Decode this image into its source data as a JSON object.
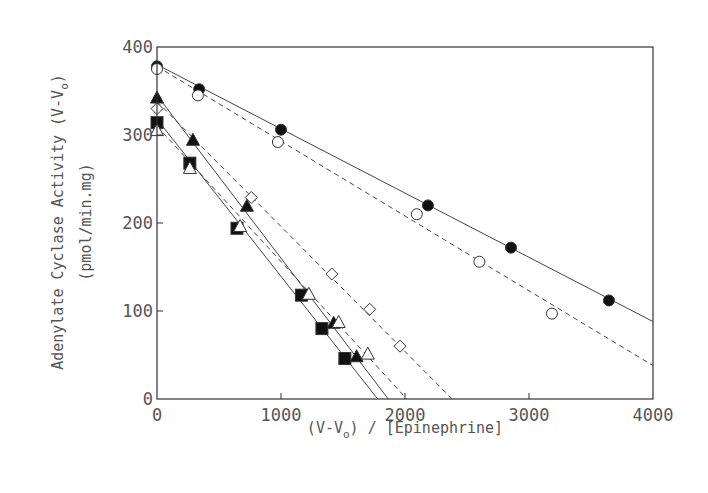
{
  "chart_data": {
    "type": "scatter",
    "title": "",
    "xlabel": "(V-Vo) / [Epinephrine]",
    "xlabel_parts": {
      "pre": "(V-V",
      "sub": "o",
      "post": ") / [Epinephrine]"
    },
    "ylabel": "Adenylate Cyclase Activity (V-Vo) (pmol/min.mg)",
    "ylabel_line1_parts": {
      "pre": "Adenylate Cyclase Activity (V-V",
      "sub": "o",
      "post": ")"
    },
    "ylabel_line2": "(pmol/min.mg)",
    "xlim": [
      0,
      4000
    ],
    "ylim": [
      0,
      400
    ],
    "xticks": [
      0,
      1000,
      2000,
      3000,
      4000
    ],
    "yticks": [
      0,
      100,
      200,
      300,
      400
    ],
    "grid": false,
    "legend": null,
    "series": [
      {
        "name": "filled circles",
        "marker": "circle-filled",
        "line": "solid",
        "points": [
          [
            0,
            378
          ],
          [
            340,
            352
          ],
          [
            1000,
            306
          ],
          [
            2185,
            220
          ],
          [
            2855,
            172
          ],
          [
            3645,
            112
          ]
        ],
        "fit_line": [
          [
            0,
            380
          ],
          [
            4000,
            88
          ]
        ]
      },
      {
        "name": "open circles",
        "marker": "circle-open",
        "line": "dashed",
        "points": [
          [
            0,
            375
          ],
          [
            330,
            345
          ],
          [
            975,
            292
          ],
          [
            2095,
            210
          ],
          [
            2600,
            156
          ],
          [
            3185,
            97
          ]
        ],
        "fit_line": [
          [
            0,
            378
          ],
          [
            4000,
            38
          ]
        ]
      },
      {
        "name": "open diamonds",
        "marker": "diamond-open",
        "line": "dashed",
        "points": [
          [
            0,
            330
          ],
          [
            760,
            229
          ],
          [
            1410,
            142
          ],
          [
            1715,
            102
          ],
          [
            1960,
            60
          ]
        ],
        "fit_line": [
          [
            0,
            338
          ],
          [
            2380,
            0
          ]
        ]
      },
      {
        "name": "filled triangles",
        "marker": "triangle-filled",
        "line": "solid",
        "points": [
          [
            0,
            342
          ],
          [
            290,
            294
          ],
          [
            725,
            219
          ],
          [
            1425,
            86
          ],
          [
            1610,
            48
          ]
        ],
        "fit_line": [
          [
            0,
            345
          ],
          [
            1865,
            0
          ]
        ]
      },
      {
        "name": "filled squares",
        "marker": "square-filled",
        "line": "solid",
        "points": [
          [
            0,
            314
          ],
          [
            265,
            268
          ],
          [
            645,
            194
          ],
          [
            1165,
            118
          ],
          [
            1330,
            80
          ],
          [
            1515,
            46
          ]
        ],
        "fit_line": [
          [
            0,
            318
          ],
          [
            1780,
            0
          ]
        ]
      },
      {
        "name": "open triangles",
        "marker": "triangle-open",
        "line": "dashed",
        "points": [
          [
            0,
            305
          ],
          [
            265,
            262
          ],
          [
            670,
            196
          ],
          [
            1225,
            119
          ],
          [
            1465,
            87
          ],
          [
            1700,
            51
          ]
        ],
        "fit_line": [
          [
            0,
            310
          ],
          [
            2015,
            0
          ]
        ]
      }
    ]
  },
  "plot_area": {
    "left": 157,
    "right": 653,
    "top": 47,
    "bottom": 399
  }
}
